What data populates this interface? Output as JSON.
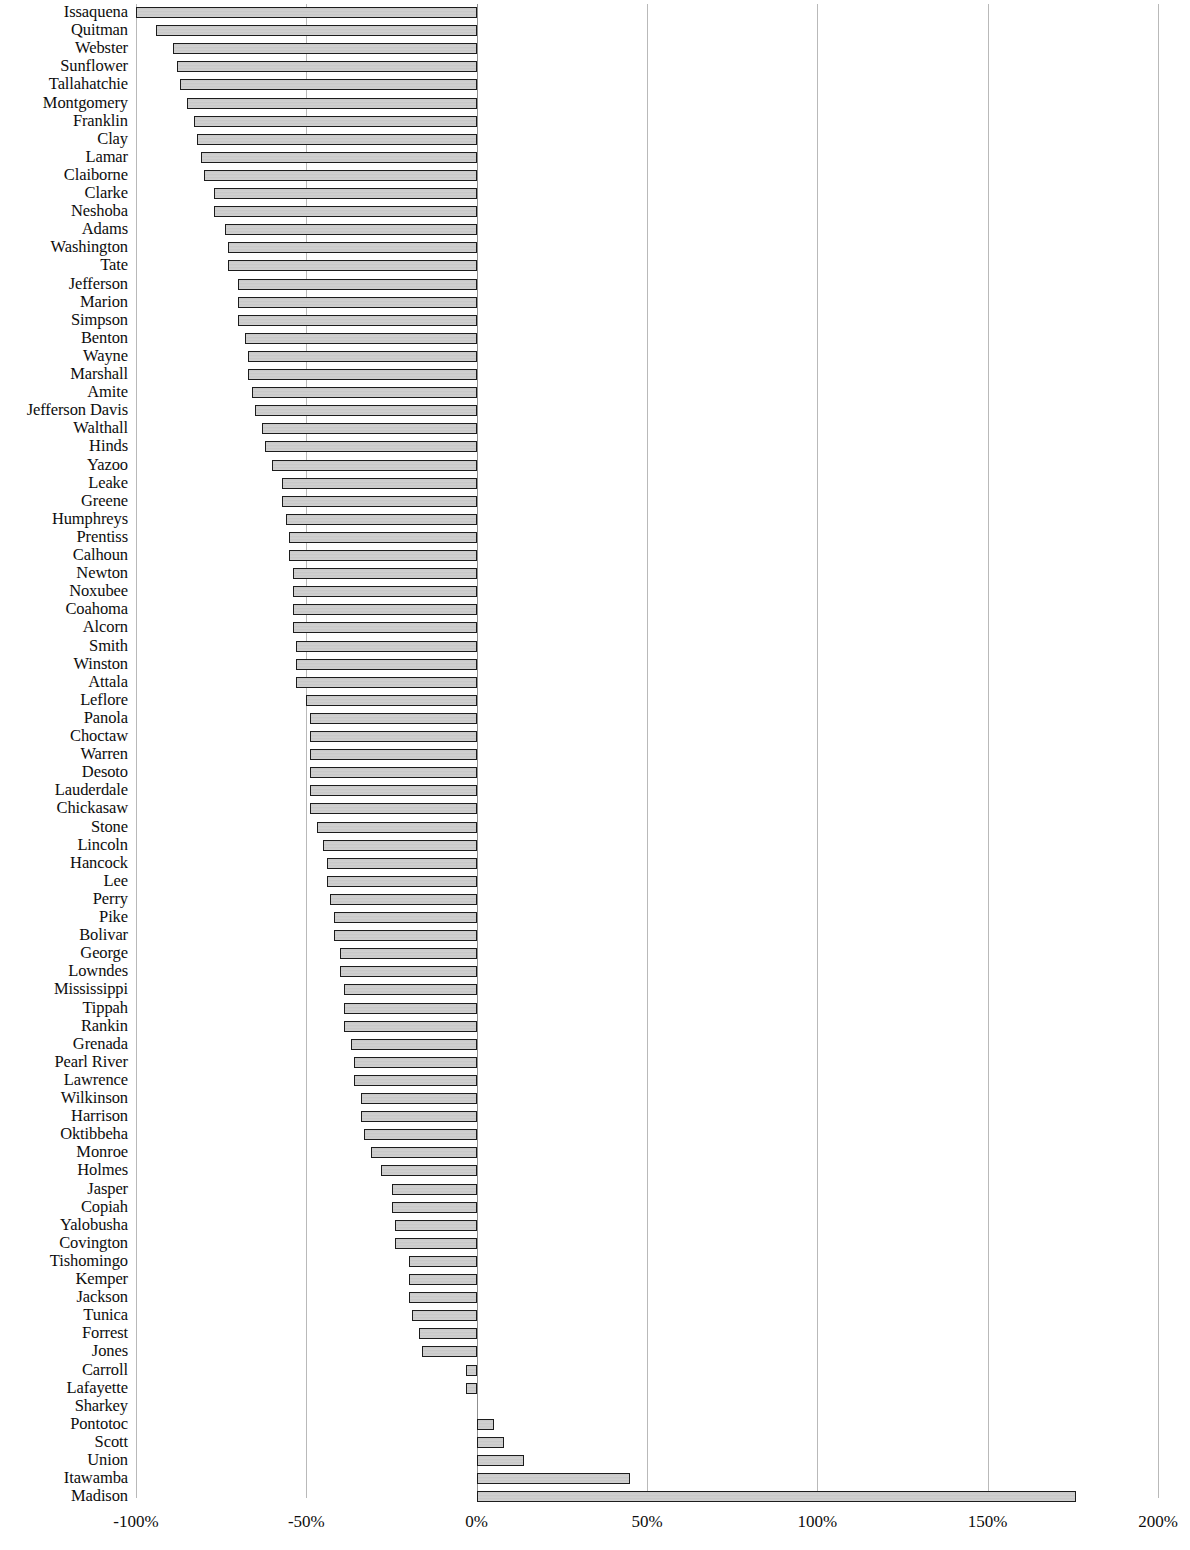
{
  "chart": {
    "type": "bar",
    "orientation": "horizontal",
    "title": "",
    "xlabel": "",
    "ylabel": ""
  },
  "axis": {
    "tick_labels": [
      "-100%",
      "-50%",
      "0%",
      "50%",
      "100%",
      "150%",
      "200%"
    ],
    "tick_values": [
      -100,
      -50,
      0,
      50,
      100,
      150,
      200
    ],
    "min": -100,
    "max": 200,
    "grid": true
  },
  "style": {
    "bar_border_color": "#1c1c1c",
    "bar_fill_color": "#cccccc",
    "gridline_color": "#b9b9b9",
    "text_color": "#0d0d0d",
    "background_color": "#ffffff"
  },
  "chart_data": {
    "type": "bar",
    "orientation": "horizontal",
    "title": "",
    "xlabel": "",
    "ylabel": "",
    "xlim": [
      -100,
      200
    ],
    "xticks": [
      -100,
      -50,
      0,
      50,
      100,
      150,
      200
    ],
    "xticklabels": [
      "-100%",
      "-50%",
      "0%",
      "50%",
      "100%",
      "150%",
      "200%"
    ],
    "grid": true,
    "legend": null,
    "units": "percent",
    "categories": [
      "Issaquena",
      "Quitman",
      "Webster",
      "Sunflower",
      "Tallahatchie",
      "Montgomery",
      "Franklin",
      "Clay",
      "Lamar",
      "Claiborne",
      "Clarke",
      "Neshoba",
      "Adams",
      "Washington",
      "Tate",
      "Jefferson",
      "Marion",
      "Simpson",
      "Benton",
      "Wayne",
      "Marshall",
      "Amite",
      "Jefferson Davis",
      "Walthall",
      "Hinds",
      "Yazoo",
      "Leake",
      "Greene",
      "Humphreys",
      "Prentiss",
      "Calhoun",
      "Newton",
      "Noxubee",
      "Coahoma",
      "Alcorn",
      "Smith",
      "Winston",
      "Attala",
      "Leflore",
      "Panola",
      "Choctaw",
      "Warren",
      "Desoto",
      "Lauderdale",
      "Chickasaw",
      "Stone",
      "Lincoln",
      "Hancock",
      "Lee",
      "Perry",
      "Pike",
      "Bolivar",
      "George",
      "Lowndes",
      "Mississippi",
      "Tippah",
      "Rankin",
      "Grenada",
      "Pearl River",
      "Lawrence",
      "Wilkinson",
      "Harrison",
      "Oktibbeha",
      "Monroe",
      "Holmes",
      "Jasper",
      "Copiah",
      "Yalobusha",
      "Covington",
      "Tishomingo",
      "Kemper",
      "Jackson",
      "Tunica",
      "Forrest",
      "Jones",
      "Carroll",
      "Lafayette",
      "Sharkey",
      "Pontotoc",
      "Scott",
      "Union",
      "Itawamba",
      "Madison"
    ],
    "values": [
      -100,
      -94,
      -89,
      -88,
      -87,
      -85,
      -83,
      -82,
      -81,
      -80,
      -77,
      -77,
      -74,
      -73,
      -73,
      -70,
      -70,
      -70,
      -68,
      -67,
      -67,
      -66,
      -65,
      -63,
      -62,
      -60,
      -57,
      -57,
      -56,
      -55,
      -55,
      -54,
      -54,
      -54,
      -54,
      -53,
      -53,
      -53,
      -50,
      -49,
      -49,
      -49,
      -49,
      -49,
      -49,
      -47,
      -45,
      -44,
      -44,
      -43,
      -42,
      -42,
      -40,
      -40,
      -39,
      -39,
      -39,
      -37,
      -36,
      -36,
      -34,
      -34,
      -33,
      -31,
      -28,
      -25,
      -25,
      -24,
      -24,
      -20,
      -20,
      -20,
      -19,
      -17,
      -16,
      -3,
      -3,
      0,
      5,
      8,
      14,
      45,
      176
    ]
  }
}
